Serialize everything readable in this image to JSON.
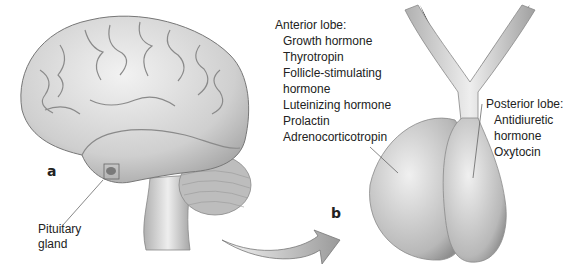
{
  "figure": {
    "panel_a": {
      "letter": "a",
      "pointer_label": [
        "Pituitary",
        "gland"
      ]
    },
    "panel_b": {
      "letter": "b",
      "anterior": {
        "title": "Anterior lobe:",
        "items": [
          "Growth hormone",
          "Thyrotropin",
          "Follicle-stimulating",
          "hormone",
          "Luteinizing hormone",
          "Prolactin",
          "Adrenocorticotropin"
        ]
      },
      "posterior": {
        "title": "Posterior lobe:",
        "items": [
          "Antidiuretic",
          "hormone",
          "Oxytocin"
        ]
      }
    }
  }
}
